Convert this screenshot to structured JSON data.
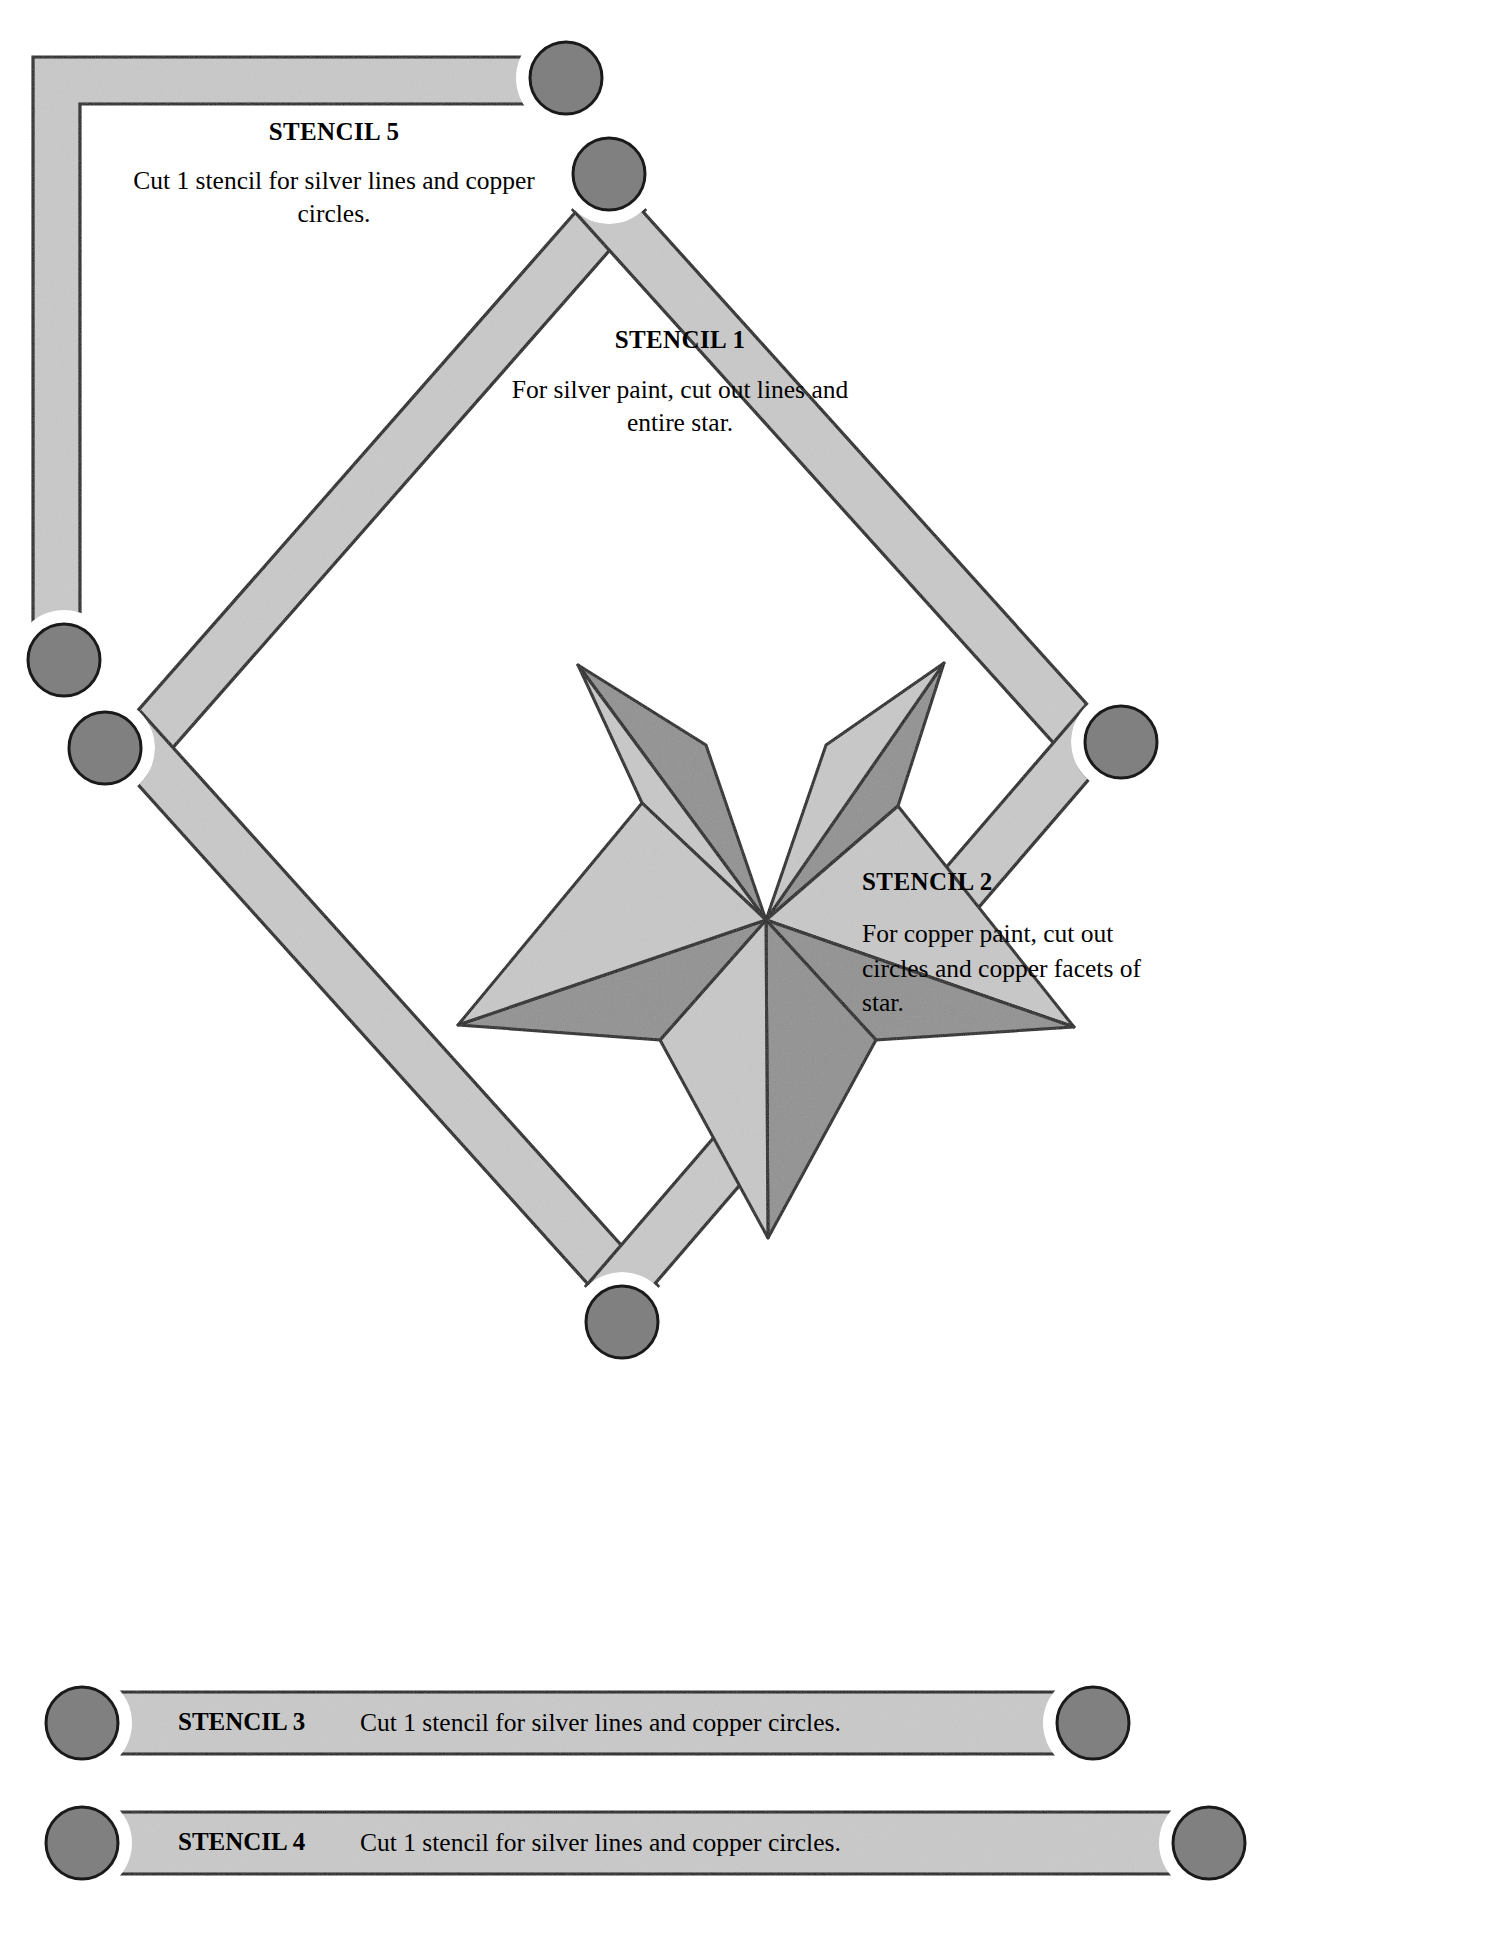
{
  "document": {
    "title": "Stencil Layout Diagram",
    "background_color": "#ffffff"
  },
  "palette": {
    "band_fill": "#c9c9c9",
    "band_stroke": "#1a1a1a",
    "circle_fill": "#808080",
    "circle_stroke": "#1a1a1a",
    "star_light_facet": "#c8c8c8",
    "star_dark_facet": "#919191",
    "star_stroke": "#1a1a1a",
    "text_color": "#000000"
  },
  "captions": {
    "stencil5": {
      "heading": "STENCIL 5",
      "body": "Cut 1 stencil for silver lines and copper circles."
    },
    "stencil1": {
      "heading": "STENCIL 1",
      "body": "For silver paint, cut out lines and entire star."
    },
    "stencil2": {
      "heading": "STENCIL 2",
      "body": "For copper paint, cut out circles and copper facets of star."
    }
  },
  "bars": [
    {
      "name": "stencil3",
      "label": "STENCIL 3",
      "text": "Cut 1 stencil for silver lines and copper circles."
    },
    {
      "name": "stencil4",
      "label": "STENCIL 4",
      "text": "Cut 1 stencil for silver lines and copper circles."
    }
  ],
  "figure": {
    "type": "diagram",
    "star": {
      "points": 5,
      "facets": 10,
      "facet_shading": [
        "light",
        "dark",
        "light",
        "dark",
        "light",
        "dark",
        "light",
        "dark",
        "light",
        "dark"
      ]
    },
    "circles_count": 10,
    "strips": [
      "stencil5-corner-strip-top-left",
      "stencil1-diamond-upper-left",
      "stencil1-diamond-upper-right",
      "stencil2-diamond-lower-left",
      "stencil2-diamond-lower-right",
      "stencil3-horizontal-bar",
      "stencil4-horizontal-bar"
    ]
  }
}
